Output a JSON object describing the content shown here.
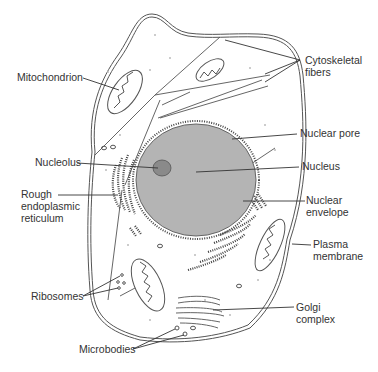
{
  "diagram": {
    "type": "labeled cell diagram",
    "colors": {
      "nucleus_fill": "#b4b4b4",
      "nucleolus_fill": "#8a8a8a",
      "line": "#555555",
      "label_text": "#333333",
      "background": "#ffffff"
    },
    "labels": {
      "mitochondrion": "Mitochondrion",
      "cytoskeletal_fibers_1": "Cytoskeletal",
      "cytoskeletal_fibers_2": "fibers",
      "nuclear_pore": "Nuclear pore",
      "nucleolus": "Nucleolus",
      "nucleus": "Nucleus",
      "rough_er_1": "Rough",
      "rough_er_2": "endoplasmic",
      "rough_er_3": "reticulum",
      "nuclear_envelope_1": "Nuclear",
      "nuclear_envelope_2": "envelope",
      "plasma_membrane_1": "Plasma",
      "plasma_membrane_2": "membrane",
      "ribosomes": "Ribosomes",
      "golgi_1": "Golgi",
      "golgi_2": "complex",
      "microbodies": "Microbodies"
    }
  }
}
